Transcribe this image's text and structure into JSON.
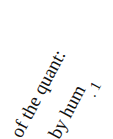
{
  "document": {
    "rotation_deg": -62,
    "text_color": "#111111",
    "background": "#ffffff",
    "lines": [
      {
        "text": "of the quant:"
      },
      {
        "text": "by hum"
      }
    ],
    "mark": ". 1"
  }
}
